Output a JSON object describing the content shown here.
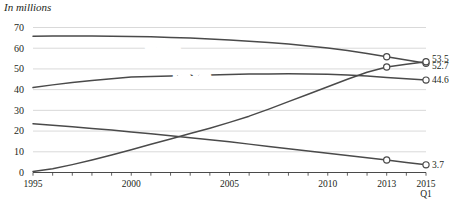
{
  "chart_data": {
    "type": "line",
    "title": "In millions",
    "xlabel": "",
    "ylabel": "",
    "ylim": [
      0,
      70
    ],
    "yticks": [
      0,
      10,
      20,
      30,
      40,
      50,
      60,
      70
    ],
    "ytick_labels": [
      "0",
      "10",
      "20",
      "30",
      "40",
      "50",
      "60",
      "70"
    ],
    "xlim": [
      1995,
      2015
    ],
    "xticks": [
      1995,
      2000,
      2005,
      2010,
      2013,
      2015
    ],
    "xtick_labels": [
      "1995",
      "2000",
      "2005",
      "2010",
      "2013",
      "2015"
    ],
    "xtick_sublabels": [
      "",
      "",
      "",
      "",
      "",
      "Q1"
    ],
    "grid": true,
    "legend_position": "inline-labels",
    "series": [
      {
        "name": "Boomers",
        "label": "Boomers",
        "label_x": 2001.6,
        "label_y": 59.5,
        "end_value": "52.7",
        "x": [
          1995,
          1996,
          1997,
          1998,
          1999,
          2000,
          2001,
          2002,
          2003,
          2004,
          2005,
          2006,
          2007,
          2008,
          2009,
          2010,
          2011,
          2012,
          2013,
          2014,
          2015
        ],
        "values": [
          65.8,
          65.9,
          65.9,
          65.9,
          65.8,
          65.7,
          65.5,
          65.2,
          64.9,
          64.5,
          64.0,
          63.4,
          62.8,
          62.0,
          61.1,
          60.1,
          58.9,
          57.5,
          55.9,
          54.3,
          52.7
        ],
        "markers": [
          {
            "x": 2013,
            "y": 55.9
          },
          {
            "x": 2015,
            "y": 52.7
          }
        ]
      },
      {
        "name": "Gen Xers",
        "label": "Gen Xers",
        "label_x": 2003.1,
        "label_y": 46.5,
        "end_value": "44.6",
        "x": [
          1995,
          1996,
          1997,
          1998,
          1999,
          2000,
          2001,
          2002,
          2003,
          2004,
          2005,
          2006,
          2007,
          2008,
          2009,
          2010,
          2011,
          2012,
          2013,
          2014,
          2015
        ],
        "values": [
          41.0,
          42.3,
          43.4,
          44.4,
          45.3,
          46.1,
          46.4,
          46.6,
          46.9,
          47.1,
          47.3,
          47.5,
          47.6,
          47.7,
          47.6,
          47.4,
          47.1,
          46.6,
          45.9,
          45.2,
          44.6
        ],
        "markers": [
          {
            "x": 2015,
            "y": 44.6
          }
        ]
      },
      {
        "name": "Millennials",
        "label": "Millennials",
        "label_x": 2005.2,
        "label_y": 35.0,
        "end_value": "53.5",
        "x": [
          1995,
          1996,
          1997,
          1998,
          1999,
          2000,
          2001,
          2002,
          2003,
          2004,
          2005,
          2006,
          2007,
          2008,
          2009,
          2010,
          2011,
          2012,
          2013,
          2014,
          2015
        ],
        "values": [
          0.5,
          1.8,
          3.8,
          6.0,
          8.4,
          11.0,
          13.6,
          16.2,
          18.8,
          21.4,
          24.2,
          27.2,
          30.6,
          34.2,
          37.8,
          41.4,
          45.0,
          48.4,
          50.9,
          52.3,
          53.5
        ],
        "markers": [
          {
            "x": 2013,
            "y": 50.9
          },
          {
            "x": 2015,
            "y": 53.5
          }
        ]
      },
      {
        "name": "Silents",
        "label": "Silents",
        "label_x": 1997.6,
        "label_y": 25.8,
        "end_value": "3.7",
        "x": [
          1995,
          1996,
          1997,
          1998,
          1999,
          2000,
          2001,
          2002,
          2003,
          2004,
          2005,
          2006,
          2007,
          2008,
          2009,
          2010,
          2011,
          2012,
          2013,
          2014,
          2015
        ],
        "values": [
          23.5,
          22.8,
          22.1,
          21.3,
          20.5,
          19.6,
          18.7,
          17.8,
          16.8,
          15.8,
          14.8,
          13.7,
          12.6,
          11.5,
          10.4,
          9.3,
          8.2,
          7.1,
          6.0,
          4.8,
          3.7
        ],
        "markers": [
          {
            "x": 2013,
            "y": 6.0
          },
          {
            "x": 2015,
            "y": 3.7
          }
        ]
      }
    ],
    "end_labels": [
      {
        "text": "53.5",
        "series": "Millennials",
        "y": 53.5,
        "offset": 3.2
      },
      {
        "text": "52.7",
        "series": "Boomers",
        "y": 52.7,
        "offset": -2.0
      },
      {
        "text": "44.6",
        "series": "Gen Xers",
        "y": 44.6,
        "offset": 0
      },
      {
        "text": "3.7",
        "series": "Silents",
        "y": 3.7,
        "offset": 0
      }
    ]
  }
}
